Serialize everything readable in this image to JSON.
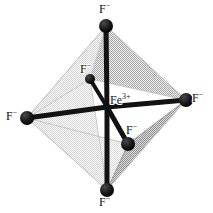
{
  "figure": {
    "background_color": "#ffffff",
    "bond_color": "#121212",
    "vertex_color": "#111111"
  },
  "center_atom": {
    "name": "Fe",
    "symbol": "Fe",
    "charge": "3+",
    "x": 107,
    "y": 107,
    "label_x": 110,
    "label_y": 94
  },
  "polyhedron": {
    "shape": "octahedron",
    "vertices": {
      "top": [
        106,
        26
      ],
      "bottom": [
        107,
        190
      ],
      "left": [
        27,
        118
      ],
      "right": [
        186,
        100
      ],
      "back": [
        90,
        79
      ],
      "front": [
        128,
        144
      ]
    },
    "faces": [
      {
        "name": "upper-left-face",
        "fill": "#e9e9e9",
        "points": "106,26 27,118 90,79"
      },
      {
        "name": "upper-right-face",
        "fill": "#c9c9c9",
        "points": "106,26 186,100 90,79"
      },
      {
        "name": "lower-left-face",
        "fill": "#efefef",
        "points": "27,118 107,190 90,79"
      },
      {
        "name": "lower-right-face",
        "fill": "#b8b8b8",
        "points": "186,100 107,190 128,144"
      },
      {
        "name": "front-lower-left-face",
        "fill": "#dcdcdc",
        "points": "27,118 107,190 128,144"
      },
      {
        "name": "outline",
        "fill": "none",
        "points": "106,26 186,100 107,190 27,118"
      }
    ],
    "edge_color": "#d0d0d0"
  },
  "ligands": [
    {
      "id": "ligand-top",
      "symbol": "F",
      "charge": "−",
      "vertex_x": 106,
      "vertex_y": 26,
      "radius": 7,
      "label_x": 99,
      "label_y": 3,
      "position": "top"
    },
    {
      "id": "ligand-bottom",
      "symbol": "F",
      "charge": "−",
      "vertex_x": 107,
      "vertex_y": 190,
      "radius": 7,
      "label_x": 99,
      "label_y": 196,
      "position": "bottom"
    },
    {
      "id": "ligand-left",
      "symbol": "F",
      "charge": "−",
      "vertex_x": 27,
      "vertex_y": 118,
      "radius": 7,
      "label_x": 6,
      "label_y": 110,
      "position": "left"
    },
    {
      "id": "ligand-right",
      "symbol": "F",
      "charge": "−",
      "vertex_x": 186,
      "vertex_y": 100,
      "radius": 7,
      "label_x": 192,
      "label_y": 92,
      "position": "right"
    },
    {
      "id": "ligand-back",
      "symbol": "F",
      "charge": "−",
      "vertex_x": 90,
      "vertex_y": 79,
      "radius": 5,
      "label_x": 80,
      "label_y": 63,
      "position": "back-upper-left"
    },
    {
      "id": "ligand-front",
      "symbol": "F",
      "charge": "−",
      "vertex_x": 128,
      "vertex_y": 144,
      "radius": 7,
      "label_x": 126,
      "label_y": 124,
      "position": "front-lower-right"
    }
  ],
  "bonds": [
    {
      "id": "bond-top",
      "from": "center",
      "to": "ligand-top",
      "width": 5
    },
    {
      "id": "bond-bottom",
      "from": "center",
      "to": "ligand-bottom",
      "width": 5
    },
    {
      "id": "bond-left",
      "from": "center",
      "to": "ligand-left",
      "width": 5
    },
    {
      "id": "bond-right",
      "from": "center",
      "to": "ligand-right",
      "width": 5
    },
    {
      "id": "bond-back",
      "from": "center",
      "to": "ligand-back",
      "width": 4
    },
    {
      "id": "bond-front",
      "from": "center",
      "to": "ligand-front",
      "width": 5
    }
  ]
}
